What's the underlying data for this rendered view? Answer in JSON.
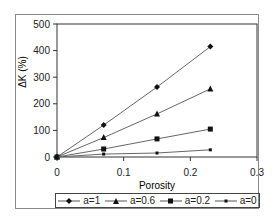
{
  "chart_data": {
    "type": "line",
    "title": "",
    "xlabel": "Porosity",
    "ylabel": "ΔK (%)",
    "xlim": [
      0,
      0.3
    ],
    "ylim": [
      0,
      500
    ],
    "xticks": [
      "0",
      "0.1",
      "0.2",
      "0.3"
    ],
    "yticks": [
      "0",
      "100",
      "200",
      "300",
      "400",
      "500"
    ],
    "grid": false,
    "legend_position": "bottom",
    "x": [
      0,
      0.07,
      0.15,
      0.23
    ],
    "series": [
      {
        "name": "a=1",
        "marker": "diamond",
        "values": [
          0,
          120,
          263,
          415
        ]
      },
      {
        "name": "a=0.6",
        "marker": "triangle",
        "values": [
          0,
          73,
          162,
          256
        ]
      },
      {
        "name": "a=0.2",
        "marker": "square",
        "values": [
          0,
          30,
          68,
          105
        ]
      },
      {
        "name": "a=0",
        "marker": "dot",
        "values": [
          0,
          11,
          15,
          27
        ]
      }
    ]
  },
  "legend": {
    "items": [
      {
        "label": "a=1"
      },
      {
        "label": "a=0.6"
      },
      {
        "label": "a=0.2"
      },
      {
        "label": "a=0"
      }
    ]
  },
  "colors": {
    "line": "#666666",
    "marker": "#111111",
    "axis": "#333333"
  }
}
